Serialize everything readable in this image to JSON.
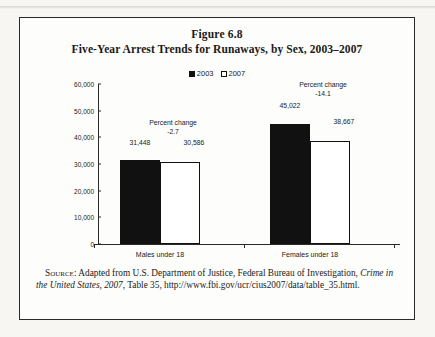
{
  "figure": {
    "number": "Figure 6.8",
    "title": "Five-Year Arrest Trends for Runaways, by Sex, 2003–2007"
  },
  "legend": {
    "items": [
      {
        "label": "2003",
        "style": "filled",
        "color": "#111111"
      },
      {
        "label": "2007",
        "style": "hollow",
        "color": "#ffffff"
      }
    ]
  },
  "axis": {
    "y_ticks": [
      "0",
      "10,000",
      "20,000",
      "30,000",
      "40,000",
      "50,000",
      "60,000"
    ],
    "y_min": 0,
    "y_max": 60000,
    "y_step": 10000
  },
  "groups": [
    {
      "category": "Males under 18",
      "value_2003": "31,448",
      "value_2007": "30,586",
      "percent_change_label": "Percent change",
      "percent_change_value": "-2.7"
    },
    {
      "category": "Females under 18",
      "value_2003": "45,022",
      "value_2007": "38,667",
      "percent_change_label": "Percent change",
      "percent_change_value": "-14.1"
    }
  ],
  "source": {
    "prefix": "Source:",
    "text_before_italic": " Adapted from U.S. Department of Justice, Federal Bureau of Investigation, ",
    "italic_title": "Crime in the United States, 2007",
    "text_after_italic": ", Table 35, http://www.fbi.gov/ucr/cius2007/data/table_35.html."
  },
  "chart_data": {
    "type": "bar",
    "title": "Five-Year Arrest Trends for Runaways, by Sex, 2003–2007",
    "subtitle": "Figure 6.8",
    "categories": [
      "Males under 18",
      "Females under 18"
    ],
    "series": [
      {
        "name": "2003",
        "values": [
          31448,
          45022
        ]
      },
      {
        "name": "2007",
        "values": [
          30586,
          38667
        ]
      }
    ],
    "annotations": [
      {
        "category": "Males under 18",
        "text": "Percent change -2.7",
        "value": -2.7
      },
      {
        "category": "Females under 18",
        "text": "Percent change -14.1",
        "value": -14.1
      }
    ],
    "xlabel": "",
    "ylabel": "",
    "ylim": [
      0,
      60000
    ],
    "ytick_values": [
      0,
      10000,
      20000,
      30000,
      40000,
      50000,
      60000
    ],
    "grid": false,
    "legend_position": "top-center"
  }
}
